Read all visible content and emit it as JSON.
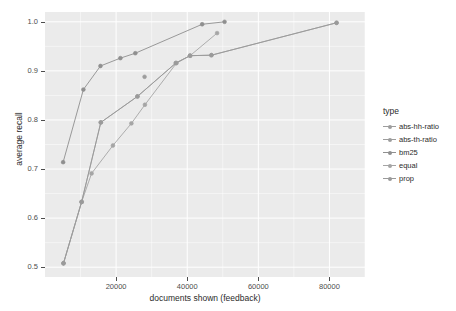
{
  "chart_data": {
    "type": "line",
    "title": "",
    "xlabel": "documents shown (feedback)",
    "ylabel": "average recall",
    "xlim": [
      0,
      90000
    ],
    "ylim": [
      0.48,
      1.02
    ],
    "xticks": [
      20000,
      40000,
      60000,
      80000
    ],
    "xticklabels": [
      "20000",
      "40000",
      "60000",
      "80000"
    ],
    "yticks": [
      0.5,
      0.6,
      0.7,
      0.8,
      0.9,
      1.0
    ],
    "yticklabels": [
      "0.5",
      "0.6",
      "0.7",
      "0.8",
      "0.9",
      "1.0"
    ],
    "grid": true,
    "grid_color": "#ffffff",
    "panel_background": "#ebebeb",
    "legend": {
      "title": "type",
      "position": "right",
      "entries": [
        "abs-hh-ratio",
        "abs-th-ratio",
        "bm25",
        "equal",
        "prop"
      ]
    },
    "series": [
      {
        "name": "abs-hh-ratio",
        "color": "#9d9d9d",
        "points": [
          {
            "x": 28000,
            "y": 0.888
          }
        ]
      },
      {
        "name": "abs-th-ratio",
        "color": "#9d9d9d",
        "points": [
          {
            "x": 5200,
            "y": 0.508
          },
          {
            "x": 10300,
            "y": 0.633
          },
          {
            "x": 15700,
            "y": 0.795
          },
          {
            "x": 26000,
            "y": 0.848
          },
          {
            "x": 36800,
            "y": 0.916
          },
          {
            "x": 40800,
            "y": 0.931
          },
          {
            "x": 46800,
            "y": 0.932
          },
          {
            "x": 82000,
            "y": 0.998
          }
        ]
      },
      {
        "name": "bm25",
        "color": "#8f8f8f",
        "points": [
          {
            "x": 5100,
            "y": 0.714
          },
          {
            "x": 10800,
            "y": 0.862
          },
          {
            "x": 15600,
            "y": 0.91
          },
          {
            "x": 21200,
            "y": 0.926
          },
          {
            "x": 25400,
            "y": 0.936
          },
          {
            "x": 44200,
            "y": 0.995
          },
          {
            "x": 50500,
            "y": 1.0
          }
        ]
      },
      {
        "name": "equal",
        "color": "#a5a5a5",
        "points": [
          {
            "x": 5200,
            "y": 0.508
          },
          {
            "x": 10300,
            "y": 0.633
          },
          {
            "x": 13100,
            "y": 0.691
          },
          {
            "x": 19100,
            "y": 0.748
          },
          {
            "x": 24300,
            "y": 0.793
          },
          {
            "x": 28100,
            "y": 0.831
          },
          {
            "x": 37000,
            "y": 0.916
          },
          {
            "x": 40800,
            "y": 0.931
          },
          {
            "x": 48400,
            "y": 0.977
          }
        ]
      },
      {
        "name": "prop",
        "color": "#9a9a9a",
        "points": [
          {
            "x": 5200,
            "y": 0.508
          },
          {
            "x": 10300,
            "y": 0.633
          },
          {
            "x": 15700,
            "y": 0.795
          },
          {
            "x": 26000,
            "y": 0.848
          },
          {
            "x": 36800,
            "y": 0.916
          },
          {
            "x": 40800,
            "y": 0.931
          },
          {
            "x": 46800,
            "y": 0.932
          },
          {
            "x": 82000,
            "y": 0.998
          }
        ]
      }
    ]
  }
}
